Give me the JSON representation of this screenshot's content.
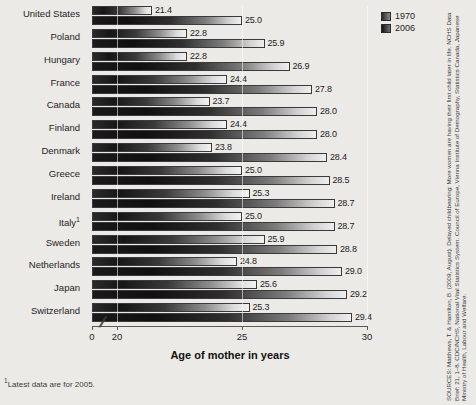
{
  "chart_data": {
    "type": "bar",
    "orientation": "horizontal",
    "title": "",
    "xlabel": "Age of mother in years",
    "ylabel": "",
    "categories": [
      "United States",
      "Poland",
      "Hungary",
      "France",
      "Canada",
      "Finland",
      "Denmark",
      "Greece",
      "Ireland",
      "Italy",
      "Sweden",
      "Netherlands",
      "Japan",
      "Switzerland"
    ],
    "category_footnote_markers": {
      "Italy": "1"
    },
    "series": [
      {
        "name": "1970",
        "values": [
          21.4,
          22.8,
          22.8,
          24.4,
          23.7,
          24.4,
          23.8,
          25.0,
          25.3,
          25.0,
          25.9,
          24.8,
          25.6,
          25.3
        ]
      },
      {
        "name": "2006",
        "values": [
          25.0,
          25.9,
          26.9,
          27.8,
          28.0,
          28.0,
          28.4,
          28.5,
          28.7,
          28.7,
          28.8,
          29.0,
          29.2,
          29.4
        ]
      }
    ],
    "xlim": [
      19,
      30
    ],
    "xticks": [
      0,
      20,
      25,
      30
    ],
    "xtick_labels": [
      "0",
      "20",
      "25",
      "30"
    ],
    "axis_break": true,
    "grid": true,
    "legend_position": "top-right",
    "value_label_format": "one-decimal"
  },
  "legend": {
    "items": [
      {
        "label": "1970"
      },
      {
        "label": "2006"
      }
    ]
  },
  "footnote": {
    "marker": "1",
    "text": "Latest data are for 2005."
  },
  "sources": {
    "text": "SOURCES: Matthews, T. & Hamilton, B. (2009, August). Delayed childbearing: More women are having their first child later in life. NCHS Data Brief: 21, 1–8. CDC/NCHS, National Vital Statistics System. Council of Europe, Vienna Institute of Demography, Statistics Canada, Japanese Ministry of Health, Labour and Welfare."
  }
}
